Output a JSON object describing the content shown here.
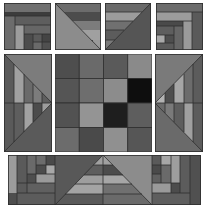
{
  "colors": {
    "background": "#ffffff",
    "darkest": "#101010",
    "very_dark": "#2a2a2a",
    "dark": "#4a4a4a",
    "mid_dark": "#5c5c5c",
    "mid": "#6e6e6e",
    "mid_light": "#828282",
    "light": "#9a9a9a",
    "lightest": "#b4b4b4",
    "seam": "#2e2e2e"
  },
  "blocks": {
    "top_row": [
      "log-cabin-block",
      "stripe-triangle-block",
      "stripe-triangle-block-mirrored",
      "log-cabin-block-mirrored"
    ],
    "middle_row": [
      "side-triangle-block-left",
      "center-4x4-grid",
      "side-triangle-block-right"
    ],
    "bottom_row": [
      "bottom-border-strip"
    ]
  },
  "center_grid": {
    "rows": 4,
    "cols": 4,
    "cells": [
      [
        "#4e4e4e",
        "#6a6a6a",
        "#5a5a5a",
        "#8a8a8a"
      ],
      [
        "#555555",
        "#6e6e6e",
        "#8c8c8c",
        "#0e0e0e"
      ],
      [
        "#525252",
        "#949494",
        "#1e1e1e",
        "#5e5e5e"
      ],
      [
        "#6c6c6c",
        "#4a4a4a",
        "#909090",
        "#565656"
      ]
    ]
  }
}
